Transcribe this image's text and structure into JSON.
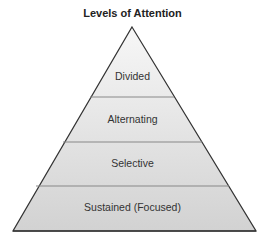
{
  "diagram": {
    "title": "Levels of Attention",
    "type": "pyramid",
    "levels": [
      {
        "label": "Divided"
      },
      {
        "label": "Alternating"
      },
      {
        "label": "Selective"
      },
      {
        "label": "Sustained (Focused)"
      }
    ],
    "colors": {
      "fill_top": "#f7f7f7",
      "fill_bottom": "#d2d2d2",
      "stroke": "#333333"
    }
  }
}
